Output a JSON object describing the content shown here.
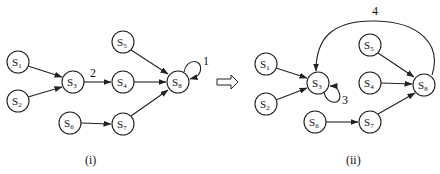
{
  "diagram": {
    "transform_arrow": "⇨",
    "panels": [
      {
        "caption": "(i)",
        "nodes": [
          {
            "id": "S1",
            "base": "S",
            "sub": "1",
            "x": 18,
            "y": 62
          },
          {
            "id": "S2",
            "base": "S",
            "sub": "2",
            "x": 18,
            "y": 101
          },
          {
            "id": "S3",
            "base": "S",
            "sub": "3",
            "x": 73,
            "y": 82
          },
          {
            "id": "S4",
            "base": "S",
            "sub": "4",
            "x": 123,
            "y": 82
          },
          {
            "id": "S5",
            "base": "S",
            "sub": "5",
            "x": 123,
            "y": 42
          },
          {
            "id": "S6",
            "base": "S",
            "sub": "6",
            "x": 70,
            "y": 123
          },
          {
            "id": "S7",
            "base": "S",
            "sub": "7",
            "x": 123,
            "y": 124
          },
          {
            "id": "S8",
            "base": "S",
            "sub": "8",
            "x": 178,
            "y": 82
          }
        ],
        "edges": [
          {
            "from": "S1",
            "to": "S3"
          },
          {
            "from": "S2",
            "to": "S3"
          },
          {
            "from": "S3",
            "to": "S4",
            "label": "2"
          },
          {
            "from": "S5",
            "to": "S8"
          },
          {
            "from": "S4",
            "to": "S8"
          },
          {
            "from": "S6",
            "to": "S7"
          },
          {
            "from": "S7",
            "to": "S8"
          },
          {
            "from": "S8",
            "to": "S8",
            "label": "1",
            "type": "self-loop"
          }
        ]
      },
      {
        "caption": "(ii)",
        "nodes": [
          {
            "id": "S1",
            "base": "S",
            "sub": "1",
            "x": 266,
            "y": 64
          },
          {
            "id": "S2",
            "base": "S",
            "sub": "2",
            "x": 266,
            "y": 104
          },
          {
            "id": "S3",
            "base": "S",
            "sub": "3",
            "x": 318,
            "y": 83
          },
          {
            "id": "S4",
            "base": "S",
            "sub": "4",
            "x": 370,
            "y": 83
          },
          {
            "id": "S5",
            "base": "S",
            "sub": "5",
            "x": 370,
            "y": 45
          },
          {
            "id": "S6",
            "base": "S",
            "sub": "6",
            "x": 315,
            "y": 122
          },
          {
            "id": "S7",
            "base": "S",
            "sub": "7",
            "x": 370,
            "y": 122
          },
          {
            "id": "S8",
            "base": "S",
            "sub": "8",
            "x": 424,
            "y": 85
          }
        ],
        "edges": [
          {
            "from": "S1",
            "to": "S3"
          },
          {
            "from": "S2",
            "to": "S3"
          },
          {
            "from": "S5",
            "to": "S8"
          },
          {
            "from": "S4",
            "to": "S8"
          },
          {
            "from": "S6",
            "to": "S7"
          },
          {
            "from": "S7",
            "to": "S8"
          },
          {
            "from": "S8",
            "to": "S3",
            "label": "4",
            "type": "arc-over"
          },
          {
            "from": "S3",
            "to": "S3",
            "label": "3",
            "type": "self-loop"
          }
        ]
      }
    ]
  }
}
